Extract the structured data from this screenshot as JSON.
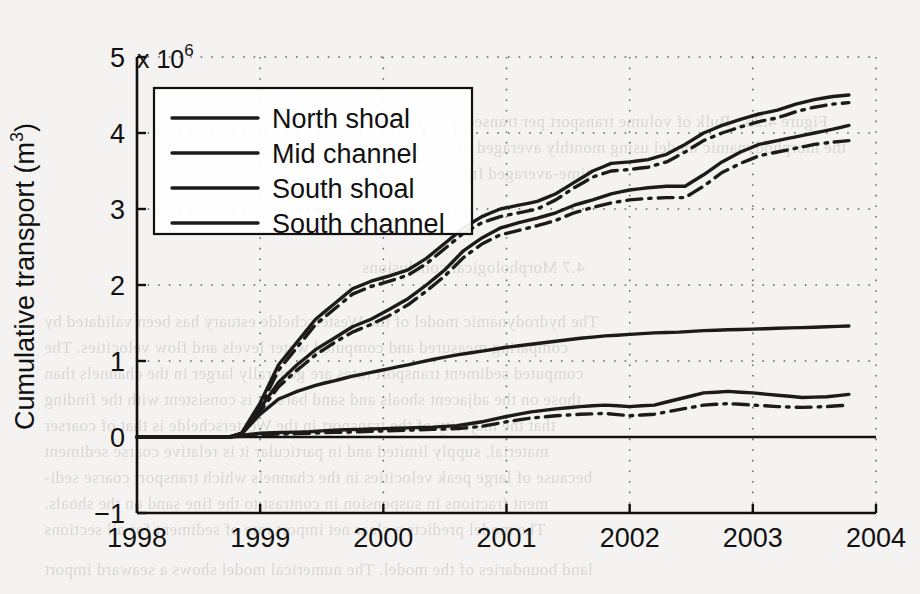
{
  "figure": {
    "background_color": "#f4f3f1",
    "ink_color": "#1b1b1b"
  },
  "axes": {
    "y_axis_label": "Cumulative transport (m",
    "y_axis_label_sup": "3",
    "y_axis_label_tail": ")",
    "exponent_prefix": "x 10",
    "exponent_power": "6",
    "y_ticks": [
      "5",
      "4",
      "3",
      "2",
      "1",
      "0",
      "−1"
    ],
    "y_tick_values": [
      5,
      4,
      3,
      2,
      1,
      0,
      -1
    ],
    "x_ticks": [
      "1998",
      "1999",
      "2000",
      "2001",
      "2002",
      "2003",
      "2004"
    ],
    "x_tick_values": [
      1998,
      1999,
      2000,
      2001,
      2002,
      2003,
      2004
    ],
    "grid": "dotted"
  },
  "legend": {
    "position": "top-left-inside",
    "items": [
      {
        "label": "North shoal",
        "style": "solid"
      },
      {
        "label": "Mid channel",
        "style": "solid"
      },
      {
        "label": "South shoal",
        "style": "solid"
      },
      {
        "label": "South channel",
        "style": "solid"
      }
    ]
  },
  "bleed_through_text": [
    {
      "text": "Figure 4.25 : Bulk of volume transport per transect computed by",
      "x": 556,
      "y": 112
    },
    {
      "text": "the morphodynamic model using monthly averaged time series and",
      "x": 556,
      "y": 138
    },
    {
      "text": "time-averaged friction velocity.",
      "x": 556,
      "y": 164
    },
    {
      "text": "4.7  Morphological conclusions",
      "x": 558,
      "y": 258
    },
    {
      "text": "The hydrodynamic model of the Westerschelde estuary has been validated by",
      "x": 876,
      "y": 312
    },
    {
      "text": "comparing measured and computed water levels and flow velocities. The",
      "x": 876,
      "y": 338
    },
    {
      "text": "computed sediment transport rates are generally larger in the channels than",
      "x": 876,
      "y": 364
    },
    {
      "text": "those on the adjacent shoals and sand bars. It is consistent with the finding",
      "x": 876,
      "y": 390
    },
    {
      "text": "that the majority of the transport in the Westerschelde is that of coarser",
      "x": 876,
      "y": 416
    },
    {
      "text": "material, supply limited and in particular it is relative coarse sediment",
      "x": 876,
      "y": 442
    },
    {
      "text": "because of large peak velocities in the channels which transport coarse sedi-",
      "x": 876,
      "y": 468
    },
    {
      "text": "ment fractions in suspension in contrast to the fine sand on the shoals.",
      "x": 876,
      "y": 494
    },
    {
      "text": "The model predicts a clear net import rate of sediment for all sections",
      "x": 876,
      "y": 520
    },
    {
      "text": "land boundaries of the model. The numerical model shows a seaward import",
      "x": 876,
      "y": 560
    }
  ],
  "chart_data": {
    "type": "line",
    "title": "",
    "xlabel": "",
    "ylabel": "Cumulative transport (m^3)",
    "y_scale_multiplier": 1000000,
    "xlim": [
      1998,
      2004
    ],
    "ylim": [
      -1,
      5
    ],
    "grid": true,
    "legend_position": "upper left",
    "series": [
      {
        "name": "North shoal",
        "style": "solid",
        "x": [
          1998.0,
          1998.75,
          1998.85,
          1999.0,
          1999.15,
          1999.3,
          1999.45,
          1999.6,
          1999.75,
          1999.9,
          2000.05,
          2000.2,
          2000.35,
          2000.5,
          2000.65,
          2000.8,
          2000.95,
          2001.1,
          2001.25,
          2001.4,
          2001.55,
          2001.7,
          2001.85,
          2002.0,
          2002.15,
          2002.3,
          2002.45,
          2002.6,
          2002.75,
          2002.9,
          2003.05,
          2003.2,
          2003.35,
          2003.5,
          2003.65,
          2003.78
        ],
        "y": [
          0.0,
          0.0,
          0.05,
          0.45,
          0.95,
          1.25,
          1.55,
          1.75,
          1.95,
          2.05,
          2.12,
          2.2,
          2.35,
          2.55,
          2.75,
          2.9,
          3.0,
          3.05,
          3.1,
          3.2,
          3.35,
          3.5,
          3.6,
          3.62,
          3.65,
          3.72,
          3.85,
          4.0,
          4.1,
          4.18,
          4.25,
          4.3,
          4.38,
          4.44,
          4.48,
          4.5
        ]
      },
      {
        "name": "North shoal (variant)",
        "style": "dash-dot",
        "x": [
          1998.0,
          1998.75,
          1998.85,
          1999.0,
          1999.15,
          1999.3,
          1999.45,
          1999.6,
          1999.75,
          1999.9,
          2000.05,
          2000.2,
          2000.35,
          2000.5,
          2000.65,
          2000.8,
          2000.95,
          2001.1,
          2001.25,
          2001.4,
          2001.55,
          2001.7,
          2001.85,
          2002.0,
          2002.15,
          2002.3,
          2002.45,
          2002.6,
          2002.75,
          2002.9,
          2003.05,
          2003.2,
          2003.35,
          2003.5,
          2003.65,
          2003.78
        ],
        "y": [
          0.0,
          0.0,
          0.04,
          0.4,
          0.88,
          1.18,
          1.48,
          1.68,
          1.88,
          1.98,
          2.05,
          2.13,
          2.28,
          2.48,
          2.68,
          2.82,
          2.9,
          2.95,
          3.0,
          3.12,
          3.28,
          3.42,
          3.5,
          3.52,
          3.55,
          3.62,
          3.75,
          3.9,
          4.0,
          4.08,
          4.15,
          4.2,
          4.28,
          4.34,
          4.38,
          4.4
        ]
      },
      {
        "name": "Mid channel",
        "style": "solid",
        "x": [
          1998.0,
          1998.75,
          1998.85,
          1999.0,
          1999.15,
          1999.3,
          1999.45,
          1999.6,
          1999.75,
          1999.9,
          2000.05,
          2000.2,
          2000.35,
          2000.5,
          2000.65,
          2000.8,
          2000.95,
          2001.1,
          2001.25,
          2001.4,
          2001.55,
          2001.7,
          2001.85,
          2002.0,
          2002.15,
          2002.3,
          2002.45,
          2002.6,
          2002.75,
          2002.9,
          2003.05,
          2003.2,
          2003.35,
          2003.5,
          2003.65,
          2003.78
        ],
        "y": [
          0.0,
          0.0,
          0.05,
          0.38,
          0.72,
          0.95,
          1.15,
          1.3,
          1.45,
          1.55,
          1.68,
          1.82,
          2.0,
          2.2,
          2.45,
          2.62,
          2.75,
          2.82,
          2.88,
          2.95,
          3.05,
          3.12,
          3.2,
          3.25,
          3.28,
          3.3,
          3.3,
          3.45,
          3.62,
          3.75,
          3.85,
          3.9,
          3.95,
          4.0,
          4.05,
          4.1
        ]
      },
      {
        "name": "Mid channel (variant)",
        "style": "dash-dot",
        "x": [
          1998.0,
          1998.75,
          1998.85,
          1999.0,
          1999.15,
          1999.3,
          1999.45,
          1999.6,
          1999.75,
          1999.9,
          2000.05,
          2000.2,
          2000.35,
          2000.5,
          2000.65,
          2000.8,
          2000.95,
          2001.1,
          2001.25,
          2001.4,
          2001.55,
          2001.7,
          2001.85,
          2002.0,
          2002.15,
          2002.3,
          2002.45,
          2002.6,
          2002.75,
          2002.9,
          2003.05,
          2003.2,
          2003.35,
          2003.5,
          2003.65,
          2003.78
        ],
        "y": [
          0.0,
          0.0,
          0.04,
          0.34,
          0.66,
          0.88,
          1.08,
          1.24,
          1.38,
          1.48,
          1.6,
          1.74,
          1.92,
          2.12,
          2.36,
          2.54,
          2.66,
          2.72,
          2.78,
          2.85,
          2.95,
          3.02,
          3.08,
          3.12,
          3.14,
          3.15,
          3.15,
          3.3,
          3.48,
          3.6,
          3.7,
          3.75,
          3.8,
          3.85,
          3.88,
          3.9
        ]
      },
      {
        "name": "South shoal",
        "style": "solid",
        "x": [
          1998.0,
          1998.75,
          1998.85,
          1999.0,
          1999.2,
          1999.4,
          1999.6,
          1999.8,
          2000.0,
          2000.2,
          2000.4,
          2000.6,
          2000.8,
          2001.0,
          2001.2,
          2001.4,
          2001.6,
          2001.8,
          2002.0,
          2002.2,
          2002.4,
          2002.6,
          2002.8,
          2003.0,
          2003.2,
          2003.4,
          2003.6,
          2003.78
        ],
        "y": [
          0.0,
          0.0,
          0.02,
          0.05,
          0.06,
          0.07,
          0.09,
          0.1,
          0.11,
          0.12,
          0.13,
          0.15,
          0.2,
          0.27,
          0.33,
          0.37,
          0.4,
          0.42,
          0.4,
          0.42,
          0.5,
          0.58,
          0.6,
          0.58,
          0.55,
          0.52,
          0.53,
          0.56
        ]
      },
      {
        "name": "South shoal (variant)",
        "style": "dash-dot",
        "x": [
          1998.0,
          1998.75,
          1998.85,
          1999.0,
          1999.2,
          1999.4,
          1999.6,
          1999.8,
          2000.0,
          2000.2,
          2000.4,
          2000.6,
          2000.8,
          2001.0,
          2001.2,
          2001.4,
          2001.6,
          2001.8,
          2002.0,
          2002.2,
          2002.4,
          2002.6,
          2002.8,
          2003.0,
          2003.2,
          2003.4,
          2003.6,
          2003.78
        ],
        "y": [
          0.0,
          0.0,
          0.01,
          0.03,
          0.04,
          0.05,
          0.06,
          0.07,
          0.08,
          0.09,
          0.1,
          0.11,
          0.14,
          0.2,
          0.25,
          0.28,
          0.3,
          0.31,
          0.28,
          0.3,
          0.36,
          0.42,
          0.44,
          0.42,
          0.4,
          0.39,
          0.4,
          0.42
        ]
      },
      {
        "name": "South channel",
        "style": "solid",
        "x": [
          1998.0,
          1998.75,
          1998.85,
          1999.0,
          1999.15,
          1999.3,
          1999.45,
          1999.6,
          1999.75,
          1999.9,
          2000.05,
          2000.2,
          2000.4,
          2000.6,
          2000.8,
          2001.0,
          2001.2,
          2001.4,
          2001.6,
          2001.8,
          2002.0,
          2002.2,
          2002.4,
          2002.6,
          2002.8,
          2003.0,
          2003.2,
          2003.4,
          2003.6,
          2003.78
        ],
        "y": [
          0.0,
          0.0,
          0.04,
          0.3,
          0.5,
          0.6,
          0.68,
          0.74,
          0.8,
          0.85,
          0.9,
          0.95,
          1.02,
          1.08,
          1.13,
          1.18,
          1.22,
          1.26,
          1.3,
          1.33,
          1.35,
          1.37,
          1.38,
          1.4,
          1.41,
          1.42,
          1.43,
          1.44,
          1.45,
          1.46
        ]
      }
    ]
  }
}
